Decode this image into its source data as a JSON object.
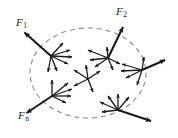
{
  "figure": {
    "type": "free-body-force-diagram",
    "background_color": "#ffffff",
    "stroke_color": "#1a1a1a",
    "dashed_color": "#8c8c8c",
    "width": 178,
    "height": 138,
    "labels": [
      {
        "id": "f1",
        "base": "F",
        "sub": "1",
        "text": "F1",
        "x": 16,
        "y": 17
      },
      {
        "id": "f2",
        "base": "F",
        "sub": "2",
        "text": "F2",
        "x": 116,
        "y": 6
      },
      {
        "id": "fn",
        "base": "F",
        "sub": "n",
        "text": "Fn",
        "x": 18,
        "y": 110
      }
    ],
    "body_boundary": {
      "shape": "ellipse-dashed",
      "cx": 88,
      "cy": 73,
      "rx": 58,
      "ry": 45,
      "dash": "5 4"
    },
    "nodes": [
      {
        "id": "node-f1",
        "x": 51,
        "y": 56,
        "label": "f1"
      },
      {
        "id": "node-f2",
        "x": 108,
        "y": 58,
        "label": "f2"
      },
      {
        "id": "node-fn",
        "x": 52,
        "y": 96,
        "label": "fn"
      },
      {
        "id": "node-right",
        "x": 142,
        "y": 70,
        "label": null
      },
      {
        "id": "node-bottom-right",
        "x": 118,
        "y": 110,
        "label": null
      },
      {
        "id": "node-center",
        "x": 88,
        "y": 79,
        "label": null
      }
    ],
    "major_vectors": [
      {
        "name": "F1",
        "from": "node-f1",
        "x1": 51,
        "y1": 56,
        "x2": 23,
        "y2": 31
      },
      {
        "name": "F2",
        "from": "node-f2",
        "x1": 108,
        "y1": 58,
        "x2": 124,
        "y2": 25
      },
      {
        "name": "Fn",
        "from": "node-fn",
        "x1": 52,
        "y1": 96,
        "x2": 25,
        "y2": 114
      },
      {
        "name": "F-right",
        "from": "node-right",
        "x1": 142,
        "y1": 70,
        "x2": 166,
        "y2": 59
      },
      {
        "name": "F-bottom-right",
        "from": "node-bottom-right",
        "x1": 118,
        "y1": 110,
        "x2": 152,
        "y2": 122
      }
    ],
    "internal_vector_counts": {
      "node-f1": 5,
      "node-f2": 6,
      "node-fn": 5,
      "node-right": 5,
      "node-bottom-right": 5,
      "node-center": 5
    }
  }
}
